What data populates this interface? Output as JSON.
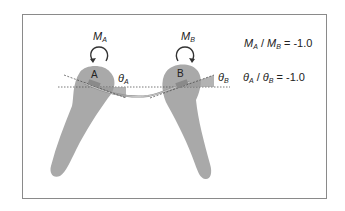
{
  "figure": {
    "teeth": [
      {
        "id": "A",
        "label": "A",
        "moment": {
          "symbol": "M",
          "subscript": "A"
        },
        "angle": {
          "symbol": "θ",
          "subscript": "A"
        }
      },
      {
        "id": "B",
        "label": "B",
        "moment": {
          "symbol": "M",
          "subscript": "B"
        },
        "angle": {
          "symbol": "θ",
          "subscript": "B"
        }
      }
    ],
    "ratios": [
      {
        "numerator": {
          "symbol": "M",
          "subscript": "A"
        },
        "separator": " / ",
        "denominator": {
          "symbol": "M",
          "subscript": "B"
        },
        "equals": " = ",
        "value": "-1.0"
      },
      {
        "numerator": {
          "symbol": "θ",
          "subscript": "A"
        },
        "separator": " / ",
        "denominator": {
          "symbol": "θ",
          "subscript": "B"
        },
        "equals": " = ",
        "value": "-1.0"
      }
    ],
    "colors": {
      "tooth_fill": "#a9a9a9",
      "wire": "#8c8c8c",
      "dotted_line": "#555555",
      "frame_border": "#8a8a8a",
      "text": "#222222"
    }
  }
}
